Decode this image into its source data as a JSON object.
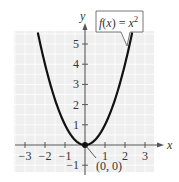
{
  "chart_data": {
    "type": "line",
    "title": "",
    "function_label": "f(x) = x^2",
    "function_label_parts": {
      "f": "f",
      "paren": "(x) = ",
      "base": "x",
      "exp": "2"
    },
    "xlabel": "x",
    "ylabel": "y",
    "xlim": [
      -3.5,
      3.5
    ],
    "ylim": [
      -1.4,
      5.5
    ],
    "xticks": [
      -3,
      -2,
      -1,
      1,
      2,
      3
    ],
    "xtick_labels": [
      "−3",
      "−2",
      "−1",
      "1",
      "2",
      "3"
    ],
    "yticks": [
      -1,
      1,
      2,
      3,
      4,
      5
    ],
    "ytick_labels": [
      "−1",
      "1",
      "2",
      "3",
      "4",
      "5"
    ],
    "grid": true,
    "series": [
      {
        "name": "f(x) = x^2",
        "x": [
          -2.35,
          -2,
          -1.5,
          -1,
          -0.5,
          0,
          0.5,
          1,
          1.5,
          2,
          2.35
        ],
        "y": [
          5.52,
          4,
          2.25,
          1,
          0.25,
          0,
          0.25,
          1,
          2.25,
          4,
          5.52
        ]
      }
    ],
    "annotations": [
      {
        "text": "(0, 0)",
        "point": [
          0,
          0
        ],
        "marker": "filled-circle"
      },
      {
        "text": "f(x) = x^2",
        "type": "callout",
        "points_to": [
          2.2,
          4.9
        ]
      }
    ],
    "colors": {
      "background_grid": "#efefef",
      "grid_line": "#ffffff",
      "curve": "#111111",
      "axis": "#555555"
    }
  }
}
